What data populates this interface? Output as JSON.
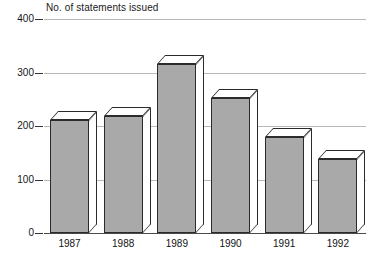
{
  "chart_data": {
    "type": "bar",
    "title": "No. of statements issued",
    "xlabel": "",
    "ylabel": "",
    "categories": [
      "1987",
      "1988",
      "1989",
      "1990",
      "1991",
      "1992"
    ],
    "values": [
      211,
      219,
      315,
      252,
      180,
      139
    ],
    "ylim": [
      0,
      400
    ],
    "yticks": [
      0,
      100,
      200,
      300,
      400
    ],
    "ytick_labels": [
      "0",
      "100",
      "200",
      "300",
      "400"
    ],
    "grid": true,
    "legend": null,
    "style": {
      "bar_fill": "#a9a9a9",
      "bar_outline": "#2b2b2b",
      "bar_top_fill": "#ffffff",
      "gridline_color": "#b9b9b9",
      "axis_color": "#4a4a4a",
      "background": "#ffffff",
      "three_d": true
    }
  }
}
